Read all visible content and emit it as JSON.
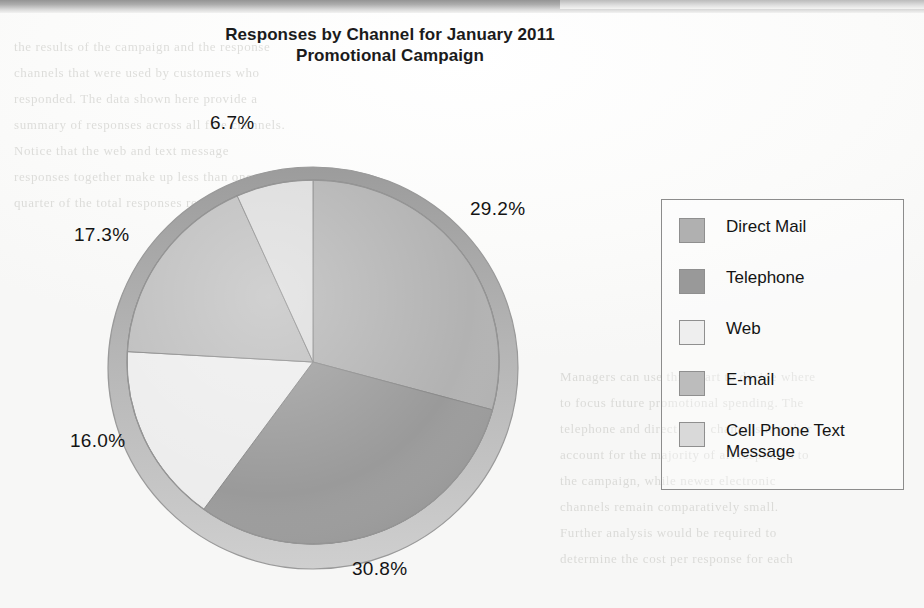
{
  "chart_data": {
    "type": "pie",
    "title": "Responses by Channel for January 2011 Promotional Campaign",
    "title_line1": "Responses by Channel for January 2011",
    "title_line2": "Promotional Campaign",
    "xlabel": "",
    "ylabel": "",
    "grid": false,
    "legend_position": "right",
    "start_angle_deg": 0,
    "direction": "clockwise",
    "style": "3d-pie-grayscale",
    "categories": [
      "Direct Mail",
      "Telephone",
      "Web",
      "E-mail",
      "Cell Phone Text Message"
    ],
    "values": [
      29.2,
      30.8,
      16.0,
      17.3,
      6.7
    ],
    "value_unit": "%",
    "slices": [
      {
        "label": "Direct Mail",
        "value": 29.2,
        "display": "29.2%",
        "color": "#b0b0b0"
      },
      {
        "label": "Telephone",
        "value": 30.8,
        "display": "30.8%",
        "color": "#999999"
      },
      {
        "label": "Web",
        "value": 16.0,
        "display": "16.0%",
        "color": "#eaeaea"
      },
      {
        "label": "E-mail",
        "value": 17.3,
        "display": "17.3%",
        "color": "#bcbcbc"
      },
      {
        "label": "Cell Phone Text Message",
        "value": 6.7,
        "display": "6.7%",
        "color": "#d9d9d9"
      }
    ],
    "data_labels": [
      "29.2%",
      "30.8%",
      "16.0%",
      "17.3%",
      "6.7%"
    ]
  },
  "chart": {
    "title_line1": "Responses by Channel for January 2011",
    "title_line2": "Promotional Campaign",
    "labels": {
      "direct_mail": "29.2%",
      "telephone": "30.8%",
      "web": "16.0%",
      "email": "17.3%",
      "cell_phone": "6.7%"
    }
  },
  "legend": {
    "items": [
      {
        "label": "Direct Mail",
        "color": "#b0b0b0"
      },
      {
        "label": "Telephone",
        "color": "#999999"
      },
      {
        "label": "Web",
        "color": "#eeeeee"
      },
      {
        "label": "E-mail",
        "color": "#bcbcbc"
      },
      {
        "label": "Cell Phone Text Message",
        "color": "#d9d9d9"
      }
    ]
  },
  "page_background": {
    "bleed_lines": [
      "the results of the campaign and the response",
      "channels that were used by customers who",
      "responded. The data shown here provide a",
      "summary of responses across all five channels.",
      "Notice that the web and text message",
      "responses together make up less than one",
      "quarter of the total responses received.",
      "",
      "Managers can use this chart to decide where",
      "to focus future promotional spending. The",
      "telephone and direct mail channels together",
      "account for the majority of all responses to",
      "the campaign, while newer electronic",
      "channels remain comparatively small.",
      "Further analysis would be required to",
      "determine the cost per response for each"
    ]
  }
}
